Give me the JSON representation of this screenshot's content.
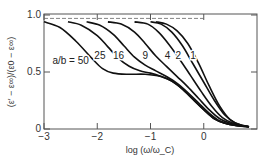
{
  "chart_data": {
    "type": "line",
    "title": "",
    "xlabel": "log (ω/ω_C)",
    "ylabel": "(ε′ − ε∞)/(ε0 − ε∞)",
    "xlim": [
      -3,
      1
    ],
    "ylim": [
      0,
      1.0
    ],
    "xticks": [
      -3,
      -2,
      -1,
      0
    ],
    "xtick_labels": [
      "−3",
      "−2",
      "−1",
      "0"
    ],
    "yticks": [
      0,
      0.5,
      1.0
    ],
    "ytick_labels": [
      "0",
      "0.5",
      "1.0"
    ],
    "grid": false,
    "reference_line": {
      "y": 0.97,
      "style": "dashed"
    },
    "legend": "inline labels",
    "legend_prefix": "a/b = ",
    "series": [
      {
        "name": "50",
        "label": "a/b = 50",
        "label_pos": [
          -2.5,
          0.6
        ],
        "points": [
          [
            -3,
            0.94
          ],
          [
            -2.7,
            0.89
          ],
          [
            -2.4,
            0.77
          ],
          [
            -2.1,
            0.62
          ],
          [
            -1.9,
            0.53
          ],
          [
            -1.7,
            0.49
          ],
          [
            -1.4,
            0.48
          ],
          [
            -1.1,
            0.48
          ],
          [
            -0.8,
            0.46
          ],
          [
            -0.6,
            0.42
          ],
          [
            -0.4,
            0.35
          ],
          [
            -0.2,
            0.26
          ],
          [
            0,
            0.17
          ],
          [
            0.2,
            0.09
          ],
          [
            0.4,
            0.05
          ],
          [
            0.6,
            0.03
          ],
          [
            0.85,
            0.02
          ]
        ]
      },
      {
        "name": "25",
        "label": "25",
        "label_pos": [
          -1.95,
          0.64
        ],
        "points": [
          [
            -2.55,
            0.94
          ],
          [
            -2.3,
            0.91
          ],
          [
            -2.0,
            0.82
          ],
          [
            -1.8,
            0.72
          ],
          [
            -1.6,
            0.62
          ],
          [
            -1.4,
            0.55
          ],
          [
            -1.2,
            0.51
          ],
          [
            -1.0,
            0.49
          ],
          [
            -0.8,
            0.46
          ],
          [
            -0.6,
            0.42
          ],
          [
            -0.4,
            0.35
          ],
          [
            -0.2,
            0.26
          ],
          [
            0,
            0.17
          ],
          [
            0.2,
            0.09
          ],
          [
            0.4,
            0.05
          ],
          [
            0.6,
            0.03
          ],
          [
            0.85,
            0.02
          ]
        ]
      },
      {
        "name": "16",
        "label": "16",
        "label_pos": [
          -1.6,
          0.64
        ],
        "points": [
          [
            -2.2,
            0.94
          ],
          [
            -1.95,
            0.91
          ],
          [
            -1.7,
            0.83
          ],
          [
            -1.5,
            0.73
          ],
          [
            -1.3,
            0.63
          ],
          [
            -1.1,
            0.56
          ],
          [
            -0.9,
            0.51
          ],
          [
            -0.7,
            0.46
          ],
          [
            -0.5,
            0.4
          ],
          [
            -0.3,
            0.32
          ],
          [
            -0.1,
            0.23
          ],
          [
            0.1,
            0.14
          ],
          [
            0.3,
            0.07
          ],
          [
            0.5,
            0.04
          ],
          [
            0.7,
            0.025
          ],
          [
            0.85,
            0.02
          ]
        ]
      },
      {
        "name": "9",
        "label": "9",
        "label_pos": [
          -1.1,
          0.64
        ],
        "points": [
          [
            -1.8,
            0.94
          ],
          [
            -1.55,
            0.92
          ],
          [
            -1.3,
            0.85
          ],
          [
            -1.1,
            0.75
          ],
          [
            -0.9,
            0.64
          ],
          [
            -0.7,
            0.55
          ],
          [
            -0.5,
            0.46
          ],
          [
            -0.3,
            0.37
          ],
          [
            -0.1,
            0.27
          ],
          [
            0.1,
            0.17
          ],
          [
            0.3,
            0.09
          ],
          [
            0.5,
            0.05
          ],
          [
            0.7,
            0.03
          ],
          [
            0.85,
            0.02
          ]
        ]
      },
      {
        "name": "4",
        "label": "4",
        "label_pos": [
          -0.68,
          0.64
        ],
        "points": [
          [
            -1.3,
            0.94
          ],
          [
            -1.05,
            0.92
          ],
          [
            -0.85,
            0.85
          ],
          [
            -0.65,
            0.74
          ],
          [
            -0.45,
            0.61
          ],
          [
            -0.25,
            0.47
          ],
          [
            -0.05,
            0.33
          ],
          [
            0.15,
            0.2
          ],
          [
            0.35,
            0.1
          ],
          [
            0.55,
            0.05
          ],
          [
            0.7,
            0.03
          ],
          [
            0.85,
            0.02
          ]
        ]
      },
      {
        "name": "2",
        "label": "2",
        "label_pos": [
          -0.48,
          0.64
        ],
        "points": [
          [
            -1.0,
            0.94
          ],
          [
            -0.8,
            0.92
          ],
          [
            -0.6,
            0.85
          ],
          [
            -0.4,
            0.73
          ],
          [
            -0.2,
            0.57
          ],
          [
            0,
            0.41
          ],
          [
            0.2,
            0.25
          ],
          [
            0.4,
            0.12
          ],
          [
            0.6,
            0.05
          ],
          [
            0.75,
            0.03
          ],
          [
            0.85,
            0.02
          ]
        ]
      },
      {
        "name": "1",
        "label": "1",
        "label_pos": [
          -0.2,
          0.64
        ],
        "points": [
          [
            -0.9,
            0.94
          ],
          [
            -0.7,
            0.92
          ],
          [
            -0.5,
            0.86
          ],
          [
            -0.3,
            0.75
          ],
          [
            -0.1,
            0.58
          ],
          [
            0.1,
            0.38
          ],
          [
            0.3,
            0.2
          ],
          [
            0.5,
            0.08
          ],
          [
            0.7,
            0.035
          ],
          [
            0.85,
            0.02
          ]
        ]
      }
    ]
  },
  "colors": {
    "curve": "#111111",
    "frame": "#555555",
    "dash": "#666666"
  }
}
